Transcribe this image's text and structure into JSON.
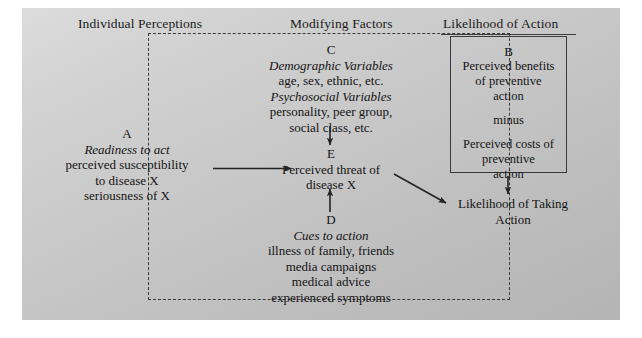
{
  "figure": {
    "background_color": "#c9c9c9",
    "line_color": "#3a3a3a",
    "text_color": "#141414"
  },
  "headers": {
    "individual_perceptions": "Individual Perceptions",
    "modifying_factors": "Modifying Factors",
    "likelihood_of_action": "Likelihood of Action"
  },
  "blocks": {
    "a": {
      "label": "A",
      "italic_line": "Readiness to act",
      "lines": [
        "perceived susceptibility",
        "to disease X",
        "seriousness of X"
      ]
    },
    "c": {
      "label": "C",
      "italic_line_1": "Demographic Variables",
      "line_1": "age, sex, ethnic, etc.",
      "italic_line_2": "Psychosocial Variables",
      "lines_2": [
        "personality, peer group,",
        "social class, etc."
      ]
    },
    "e": {
      "label": "E",
      "lines": [
        "Perceived threat of",
        "disease X"
      ]
    },
    "d": {
      "label": "D",
      "italic_line": "Cues to action",
      "lines": [
        "illness of family, friends",
        "media campaigns",
        "medical advice",
        "experienced symptoms"
      ]
    },
    "b": {
      "label": "B",
      "lines_top": [
        "Perceived benefits",
        "of preventive",
        "action"
      ],
      "connector": "minus",
      "lines_bottom": [
        "Perceived costs of",
        "preventive",
        "action"
      ]
    },
    "outcome": {
      "lines": [
        "Likelihood of Taking",
        "Action"
      ]
    }
  },
  "arrows": [
    {
      "name": "a-to-e",
      "from": "A",
      "to": "E",
      "direction": "right"
    },
    {
      "name": "c-to-e",
      "from": "C",
      "to": "E",
      "direction": "down"
    },
    {
      "name": "d-to-e",
      "from": "D",
      "to": "E",
      "direction": "up"
    },
    {
      "name": "e-to-outcome",
      "from": "E",
      "to": "Likelihood of Taking Action",
      "direction": "diagonal-down-right"
    },
    {
      "name": "b-to-outcome",
      "from": "B",
      "to": "Likelihood of Taking Action",
      "direction": "down"
    }
  ]
}
